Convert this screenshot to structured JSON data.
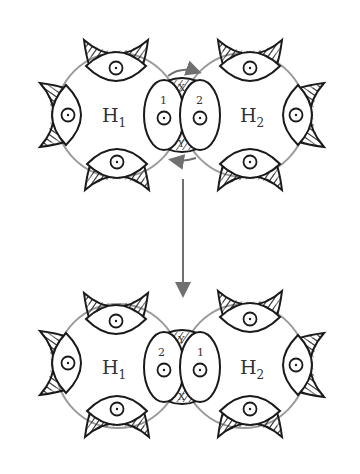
{
  "colors": {
    "ring": "#9a9a9a",
    "ink": "#1a1a1a",
    "arrow": "#707070",
    "background": "#ffffff"
  },
  "top_panel": {
    "left_ring_label": "H",
    "left_ring_sub": "1",
    "right_ring_label": "H",
    "right_ring_sub": "2",
    "left_junction_number": "1",
    "right_junction_number": "2",
    "upper_junction_letter": "X",
    "lower_junction_letter": "Y"
  },
  "bottom_panel": {
    "left_ring_label": "H",
    "left_ring_sub": "1",
    "right_ring_label": "H",
    "right_ring_sub": "2",
    "left_junction_number": "2",
    "right_junction_number": "1",
    "upper_junction_letter": "Y",
    "lower_junction_letter": "X"
  },
  "arrows": {
    "top_rotation": "clockwise-arrow-over-junction",
    "bottom_rotation": "counterclockwise-arrow-under-junction",
    "transition": "down-arrow"
  }
}
